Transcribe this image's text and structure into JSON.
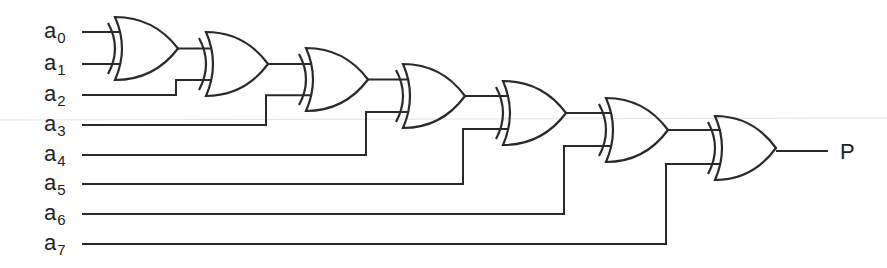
{
  "diagram": {
    "inputs": [
      {
        "base": "a",
        "sub": "0",
        "y": 32
      },
      {
        "base": "a",
        "sub": "1",
        "y": 64
      },
      {
        "base": "a",
        "sub": "2",
        "y": 95
      },
      {
        "base": "a",
        "sub": "3",
        "y": 125
      },
      {
        "base": "a",
        "sub": "4",
        "y": 155
      },
      {
        "base": "a",
        "sub": "5",
        "y": 184
      },
      {
        "base": "a",
        "sub": "6",
        "y": 214
      },
      {
        "base": "a",
        "sub": "7",
        "y": 244
      }
    ],
    "gates": [
      {
        "id": "xor1",
        "type": "XOR",
        "x": 115,
        "top": 17,
        "bottom": 80,
        "tip": 178
      },
      {
        "id": "xor2",
        "type": "XOR",
        "x": 206,
        "top": 32,
        "bottom": 96,
        "tip": 268
      },
      {
        "id": "xor3",
        "type": "XOR",
        "x": 306,
        "top": 48,
        "bottom": 111,
        "tip": 368
      },
      {
        "id": "xor4",
        "type": "XOR",
        "x": 403,
        "top": 64,
        "bottom": 128,
        "tip": 465
      },
      {
        "id": "xor5",
        "type": "XOR",
        "x": 503,
        "top": 81,
        "bottom": 145,
        "tip": 566
      },
      {
        "id": "xor6",
        "type": "XOR",
        "x": 606,
        "top": 98,
        "bottom": 162,
        "tip": 668
      },
      {
        "id": "xor7",
        "type": "XOR",
        "x": 715,
        "top": 116,
        "bottom": 180,
        "tip": 776
      }
    ],
    "output": {
      "label": "P"
    },
    "colors": {
      "line": "#2a2a2a",
      "text": "#222222",
      "background": "#ffffff"
    }
  }
}
